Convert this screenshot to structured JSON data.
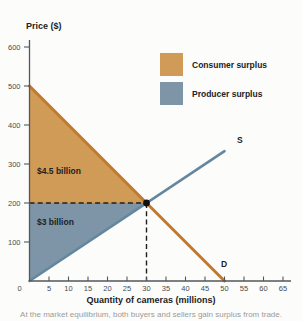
{
  "figure": {
    "background": "#fcfcfb",
    "y_axis_title": "Price ($)",
    "x_axis_title": "Quantity of cameras (millions)",
    "caption": "At the market equilibrium, both buyers and sellers gain surplus from trade."
  },
  "chart_data": {
    "type": "line",
    "subtype": "supply-demand-surplus",
    "title": "",
    "xlabel": "Quantity of cameras (millions)",
    "ylabel": "Price ($)",
    "xlim": [
      0,
      65
    ],
    "ylim": [
      0,
      600
    ],
    "x_ticks": [
      0,
      5,
      10,
      15,
      20,
      25,
      30,
      35,
      40,
      45,
      50,
      55,
      60,
      65
    ],
    "y_ticks": [
      100,
      200,
      300,
      400,
      500,
      600
    ],
    "grid": false,
    "legend_position": "top-right",
    "series": [
      {
        "name": "D",
        "role": "demand",
        "color": "#c07a2e",
        "points": [
          [
            0,
            500
          ],
          [
            50,
            0
          ]
        ]
      },
      {
        "name": "S",
        "role": "supply",
        "color": "#64869e",
        "points": [
          [
            0,
            0
          ],
          [
            50,
            333
          ]
        ]
      }
    ],
    "equilibrium": {
      "quantity_millions": 30,
      "price": 200
    },
    "regions": [
      {
        "name": "Consumer surplus",
        "label": "$4.5 billion",
        "color": "#d09b57",
        "vertices": [
          [
            0,
            500
          ],
          [
            0,
            200
          ],
          [
            30,
            200
          ]
        ]
      },
      {
        "name": "Producer surplus",
        "label": "$3 billion",
        "color": "#7d95a7",
        "vertices": [
          [
            0,
            200
          ],
          [
            30,
            200
          ],
          [
            0,
            0
          ]
        ]
      }
    ],
    "legend": [
      {
        "label": "Consumer surplus",
        "color": "#d09b57"
      },
      {
        "label": "Producer surplus",
        "color": "#7d95a7"
      }
    ],
    "dashed_guides": [
      {
        "from": [
          0,
          200
        ],
        "to": [
          30,
          200
        ]
      },
      {
        "from": [
          30,
          200
        ],
        "to": [
          30,
          0
        ]
      }
    ],
    "colors": {
      "axis": "#55565a",
      "tick_text": "#4b4b4d",
      "dashed": "#1f1f1f",
      "equilibrium_dot": "#111111"
    }
  }
}
